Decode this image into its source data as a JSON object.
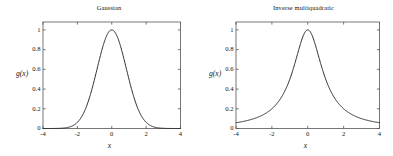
{
  "figure": {
    "background": "#ffffff",
    "line_color": "#222222",
    "axis_color": "#555555"
  },
  "chart_data": [
    {
      "type": "line",
      "title": "Gaussian",
      "xlabel": "x",
      "ylabel": "g(x)",
      "xlim": [
        -4,
        4
      ],
      "ylim": [
        0,
        1.08
      ],
      "grid": false,
      "legend": null,
      "xticks": [
        -4,
        -2,
        0,
        2,
        4
      ],
      "xticklabels": [
        "-4",
        "-2",
        "0",
        "2",
        "4"
      ],
      "yticks": [
        0,
        0.2,
        0.4,
        0.6,
        0.8,
        1
      ],
      "yticklabels": [
        "0",
        "0.2",
        "0.4",
        "0.6",
        "0.8",
        "1"
      ],
      "formula": "exp(-x^2 / (2*0.85^2))",
      "x": [
        -4,
        -3.75,
        -3.5,
        -3.25,
        -3,
        -2.75,
        -2.5,
        -2.25,
        -2,
        -1.75,
        -1.5,
        -1.25,
        -1,
        -0.75,
        -0.5,
        -0.25,
        0,
        0.25,
        0.5,
        0.75,
        1,
        1.25,
        1.5,
        1.75,
        2,
        2.25,
        2.5,
        2.75,
        3,
        3.25,
        3.5,
        3.75,
        4
      ],
      "values": [
        0.0,
        0.0001,
        0.0002,
        0.0007,
        0.0019,
        0.0052,
        0.0131,
        0.0303,
        0.0625,
        0.1189,
        0.208,
        0.3367,
        0.5,
        0.678,
        0.8409,
        0.9575,
        1.0,
        0.9575,
        0.8409,
        0.678,
        0.5,
        0.3367,
        0.208,
        0.1189,
        0.0625,
        0.0303,
        0.0131,
        0.0052,
        0.0019,
        0.0007,
        0.0002,
        0.0001,
        0.0
      ]
    },
    {
      "type": "line",
      "title": "Inverse multiquadratic",
      "xlabel": "x",
      "ylabel": "g(x)",
      "xlim": [
        -4,
        4
      ],
      "ylim": [
        0,
        1.08
      ],
      "grid": false,
      "legend": null,
      "xticks": [
        -4,
        -2,
        0,
        2,
        4
      ],
      "xticklabels": [
        "-4",
        "-2",
        "0",
        "2",
        "4"
      ],
      "yticks": [
        0,
        0.2,
        0.4,
        0.6,
        0.8,
        1
      ],
      "yticklabels": [
        "0",
        "0.2",
        "0.4",
        "0.6",
        "0.8",
        "1"
      ],
      "formula": "1 / (1 + x^2)",
      "x": [
        -4,
        -3.75,
        -3.5,
        -3.25,
        -3,
        -2.75,
        -2.5,
        -2.25,
        -2,
        -1.75,
        -1.5,
        -1.25,
        -1,
        -0.75,
        -0.5,
        -0.25,
        0,
        0.25,
        0.5,
        0.75,
        1,
        1.25,
        1.5,
        1.75,
        2,
        2.25,
        2.5,
        2.75,
        3,
        3.25,
        3.5,
        3.75,
        4
      ],
      "values": [
        0.0588,
        0.0664,
        0.0755,
        0.0865,
        0.1,
        0.1168,
        0.1379,
        0.1649,
        0.2,
        0.2462,
        0.3077,
        0.3902,
        0.5,
        0.64,
        0.8,
        0.9412,
        1.0,
        0.9412,
        0.8,
        0.64,
        0.5,
        0.3902,
        0.3077,
        0.2462,
        0.2,
        0.1649,
        0.1379,
        0.1168,
        0.1,
        0.0865,
        0.0755,
        0.0664,
        0.0588
      ]
    }
  ]
}
